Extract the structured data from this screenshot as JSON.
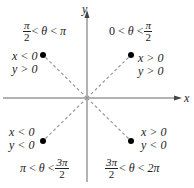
{
  "axes": {
    "x_label": "x",
    "y_label": "y",
    "origin": [
      87,
      98
    ]
  },
  "quadrants": [
    {
      "id": "Q1",
      "range": {
        "left": "0",
        "op1": "<",
        "var": "θ",
        "op2": "<",
        "right_num": "π",
        "right_den": "2"
      },
      "conditions": [
        "x > 0",
        "y > 0"
      ]
    },
    {
      "id": "Q2",
      "range": {
        "left_num": "π",
        "left_den": "2",
        "op1": "<",
        "var": "θ",
        "op2": "<",
        "right": "π"
      },
      "conditions": [
        "x < 0",
        "y > 0"
      ]
    },
    {
      "id": "Q3",
      "range": {
        "left": "π",
        "op1": "<",
        "var": "θ",
        "op2": "<",
        "right_num": "3π",
        "right_den": "2"
      },
      "conditions": [
        "x < 0",
        "y < 0"
      ]
    },
    {
      "id": "Q4",
      "range": {
        "left_num": "3π",
        "left_den": "2",
        "op1": "<",
        "var": "θ",
        "op2": "<",
        "right": "2π"
      },
      "conditions": [
        "x > 0",
        "y < 0"
      ]
    }
  ],
  "colors": {
    "axis": "#555555",
    "dash": "#999999",
    "point": "#000000"
  }
}
